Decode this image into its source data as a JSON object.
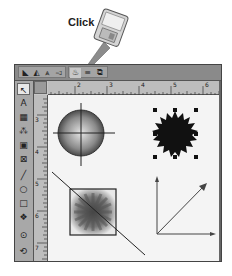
{
  "callout": {
    "label": "Click",
    "icon": "floppy-disk-pointer-icon",
    "arrow_color": "#8a8a8a"
  },
  "window": {
    "toolbar": {
      "groups": [
        {
          "name": "text-path-tools",
          "buttons": [
            {
              "name": "text-path-left-button",
              "glyph": "◣"
            },
            {
              "name": "text-path-arc-button",
              "glyph": "◭"
            },
            {
              "name": "text-path-peak-button",
              "glyph": "⩓"
            },
            {
              "name": "text-path-skew-button",
              "glyph": "◅"
            }
          ]
        },
        {
          "name": "item-tools",
          "buttons": [
            {
              "name": "color-tool-button",
              "glyph": "♨",
              "highlighted": true
            },
            {
              "name": "align-button",
              "glyph": "≡"
            },
            {
              "name": "layer-button",
              "glyph": "⧉"
            }
          ]
        }
      ]
    },
    "horizontal_ruler": {
      "labels": [
        "2",
        "3",
        "4",
        "5",
        "6",
        "7"
      ]
    },
    "vertical_ruler": {
      "labels": [
        "3",
        "4",
        "5",
        "6",
        "7"
      ]
    },
    "toolbox": {
      "tools": [
        {
          "name": "pointer-tool",
          "glyph": "↖"
        },
        {
          "name": "text-tool",
          "glyph": "A"
        },
        {
          "name": "table-tool",
          "glyph": "▦"
        },
        {
          "name": "link-tool",
          "glyph": "⁂"
        },
        {
          "name": "picture-tool",
          "glyph": "▣"
        },
        {
          "name": "picture-box-tool",
          "glyph": "⊠"
        },
        {
          "name": "line-tool",
          "glyph": "╱"
        },
        {
          "name": "oval-tool",
          "glyph": "○"
        },
        {
          "name": "rectangle-tool",
          "glyph": "□"
        },
        {
          "name": "shape-tool",
          "glyph": "❖"
        },
        {
          "name": "zoom-tool",
          "glyph": "⊙"
        },
        {
          "name": "rotate-tool",
          "glyph": "⟲"
        }
      ]
    },
    "canvas": {
      "objects": [
        {
          "name": "crosshair-gradient-circle",
          "type": "radial-gradient circle with crosshair"
        },
        {
          "name": "selected-starburst",
          "type": "black starburst with selection handles"
        },
        {
          "name": "square-starburst-gradient",
          "type": "square with radial burst and diagonal line"
        },
        {
          "name": "vector-axes",
          "type": "axes with diagonal arrow"
        }
      ]
    }
  }
}
